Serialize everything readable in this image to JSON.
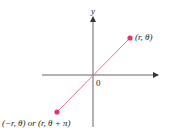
{
  "diagram": {
    "type": "polar-coordinates-negative-r",
    "axes": {
      "y_label": "y",
      "origin_label": "0"
    },
    "points": [
      {
        "id": "point-r-theta",
        "label": "(r, θ)",
        "x": 130,
        "y": 38
      },
      {
        "id": "point-neg-r-theta",
        "label": "(−r, θ) or (r, θ + π)",
        "x": 57,
        "y": 112
      }
    ],
    "colors": {
      "axis": "#333333",
      "line": "#e7739a",
      "point": "#e0356f",
      "text": "#222222"
    }
  }
}
